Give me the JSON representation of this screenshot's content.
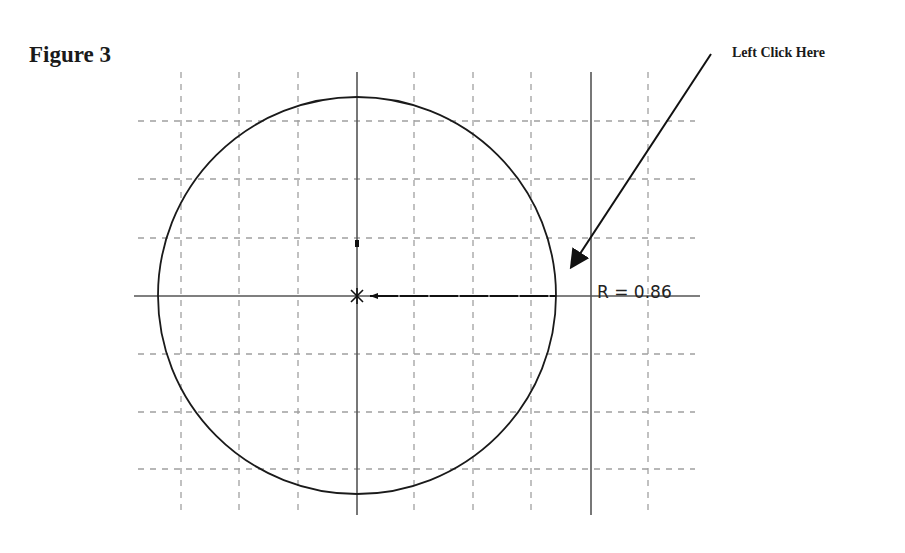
{
  "figure": {
    "title": "Figure 3"
  },
  "callout": {
    "text": "Left Click Here"
  },
  "dimension": {
    "label": "R = 0.86",
    "radius_value": 0.86
  },
  "colors": {
    "grid": "#a0a0a0",
    "axis": "#555555",
    "circle": "#1a1a1a",
    "arrow": "#111111"
  }
}
